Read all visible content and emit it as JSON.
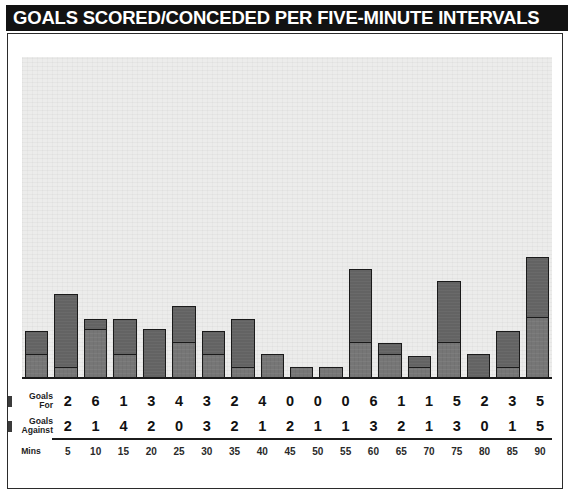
{
  "title": "GOALS SCORED/CONCEDED PER FIVE-MINUTE INTERVALS",
  "legend": {
    "for_line1": "Goals",
    "for_line2": "For",
    "against_line1": "Goals",
    "against_line2": "Against",
    "mins_label": "Mins"
  },
  "colors": {
    "title_bar": "#121212",
    "title_text": "#ffffff",
    "plot_background": "#ececeb",
    "bar_for": "#636363",
    "bar_against": "#767676",
    "bar_outline": "#1a1a1a",
    "panel_border": "#2b2b2b",
    "table_text": "#111111"
  },
  "chart_data": {
    "type": "bar",
    "title": "GOALS SCORED/CONCEDED PER FIVE-MINUTE INTERVALS",
    "xlabel": "Mins",
    "ylabel": "",
    "stacked": true,
    "grid": false,
    "legend_position": "left-table",
    "ylim": [
      0,
      26
    ],
    "categories": [
      "5",
      "10",
      "15",
      "20",
      "25",
      "30",
      "35",
      "40",
      "45",
      "50",
      "55",
      "60",
      "65",
      "70",
      "75",
      "80",
      "85",
      "90"
    ],
    "series": [
      {
        "name": "Goals For",
        "values": [
          2,
          6,
          1,
          3,
          4,
          3,
          2,
          4,
          0,
          0,
          0,
          6,
          1,
          1,
          5,
          2,
          3,
          5
        ]
      },
      {
        "name": "Goals Against",
        "values": [
          2,
          1,
          4,
          2,
          0,
          3,
          2,
          1,
          2,
          1,
          1,
          3,
          2,
          1,
          3,
          0,
          1,
          5
        ]
      }
    ]
  }
}
